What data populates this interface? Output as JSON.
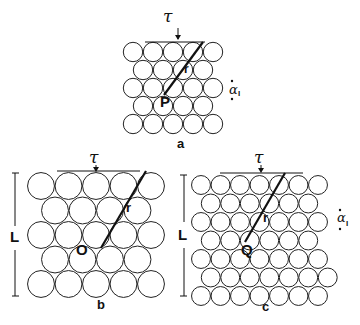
{
  "figure": {
    "panels": [
      {
        "id": "a",
        "label": "a",
        "stress_symbol": "τ",
        "origin_point": "P",
        "vector_label": "r",
        "spacing_symbol": "α",
        "spacing_subscript": "I",
        "rows": 5,
        "circles_per_row": [
          5,
          4,
          5,
          4,
          5
        ]
      },
      {
        "id": "b",
        "label": "b",
        "stress_symbol": "τ",
        "origin_point": "O",
        "vector_label": "r",
        "length_label": "L",
        "rows": 5,
        "circles_per_row": [
          5,
          4,
          5,
          4,
          5
        ]
      },
      {
        "id": "c",
        "label": "c",
        "stress_symbol": "τ",
        "origin_point": "Q",
        "vector_label": "r",
        "length_label": "L",
        "spacing_symbol": "α",
        "spacing_subscript": "I",
        "rows": 7,
        "circles_per_row": [
          7,
          6,
          7,
          6,
          7,
          7,
          7
        ]
      }
    ],
    "caption_partial": ""
  }
}
